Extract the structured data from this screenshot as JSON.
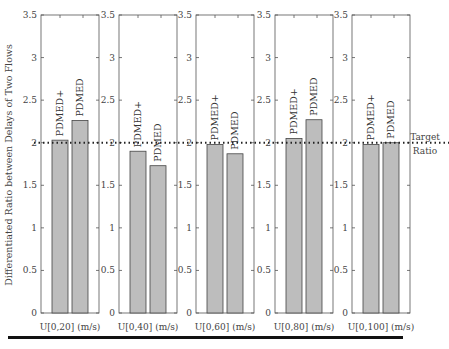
{
  "chart_data": {
    "type": "bar",
    "title": "",
    "ylabel": "Differentiated Ratio between Delays of Two Flows",
    "ylim": [
      0,
      3.5
    ],
    "yticks": [
      0,
      0.5,
      1,
      1.5,
      2,
      2.5,
      3,
      3.5
    ],
    "ytick_labels": [
      "0",
      "0.5",
      "1",
      "1.5",
      "2",
      "2.5",
      "3",
      "3.5"
    ],
    "grid": false,
    "bar_color": "#bdbdbd",
    "bar_labels": [
      "PDMED+",
      "PDMED"
    ],
    "target_line": {
      "value": 2,
      "label_line1": "Target",
      "label_line2": "Ratio",
      "style": "dotted"
    },
    "panels": [
      {
        "xlabel": "U[0,20] (m/s)",
        "categories": [
          "PDMED+",
          "PDMED"
        ],
        "values": [
          2.03,
          2.26
        ]
      },
      {
        "xlabel": "U[0,40] (m/s)",
        "categories": [
          "PDMED+",
          "PDMED"
        ],
        "values": [
          1.9,
          1.73
        ]
      },
      {
        "xlabel": "U[0,60] (m/s)",
        "categories": [
          "PDMED+",
          "PDMED"
        ],
        "values": [
          1.98,
          1.87
        ]
      },
      {
        "xlabel": "U[0,80] (m/s)",
        "categories": [
          "PDMED+",
          "PDMED"
        ],
        "values": [
          2.05,
          2.27
        ]
      },
      {
        "xlabel": "U[0,100] (m/s)",
        "categories": [
          "PDMED+",
          "PDMED"
        ],
        "values": [
          1.98,
          2.0
        ]
      }
    ]
  }
}
